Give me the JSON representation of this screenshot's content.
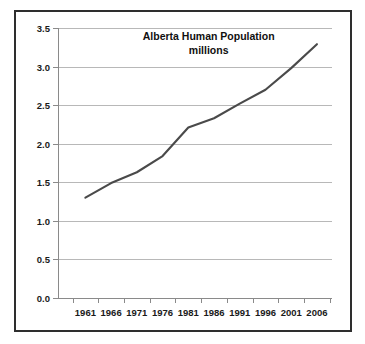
{
  "figure": {
    "border_color": "#2e2e2e",
    "background_color": "#ffffff"
  },
  "chart_data": {
    "type": "line",
    "title_lines": [
      "Alberta Human Population",
      "millions"
    ],
    "xlabel": "",
    "ylabel": "",
    "categories": [
      "1961",
      "1966",
      "1971",
      "1976",
      "1981",
      "1986",
      "1991",
      "1996",
      "2001",
      "2006"
    ],
    "x": [
      1961,
      1966,
      1971,
      1976,
      1981,
      1986,
      1991,
      1996,
      2001,
      2006
    ],
    "values": [
      1.3,
      1.49,
      1.63,
      1.84,
      2.21,
      2.33,
      2.52,
      2.7,
      2.98,
      3.29
    ],
    "series": [
      {
        "name": "Alberta Human Population (millions)",
        "color": "#4a4a4a",
        "values": [
          1.3,
          1.49,
          1.63,
          1.84,
          2.21,
          2.33,
          2.52,
          2.7,
          2.98,
          3.29
        ]
      }
    ],
    "ylim": [
      0.0,
      3.5
    ],
    "yticks": [
      0.0,
      0.5,
      1.0,
      1.5,
      2.0,
      2.5,
      3.0,
      3.5
    ],
    "ytick_labels": [
      "0.0",
      "0.5",
      "1.0",
      "1.5",
      "2.0",
      "2.5",
      "3.0",
      "3.5"
    ],
    "xtick_labels": [
      "1961",
      "1966",
      "1971",
      "1976",
      "1981",
      "1986",
      "1991",
      "1996",
      "2001",
      "2006"
    ],
    "grid": true,
    "grid_axis": "y",
    "legend": false,
    "legend_position": "none",
    "markers": false,
    "line_color": "#4a4a4a",
    "gridline_color": "#b8b8b8",
    "axis_color": "#8a8a8a"
  }
}
